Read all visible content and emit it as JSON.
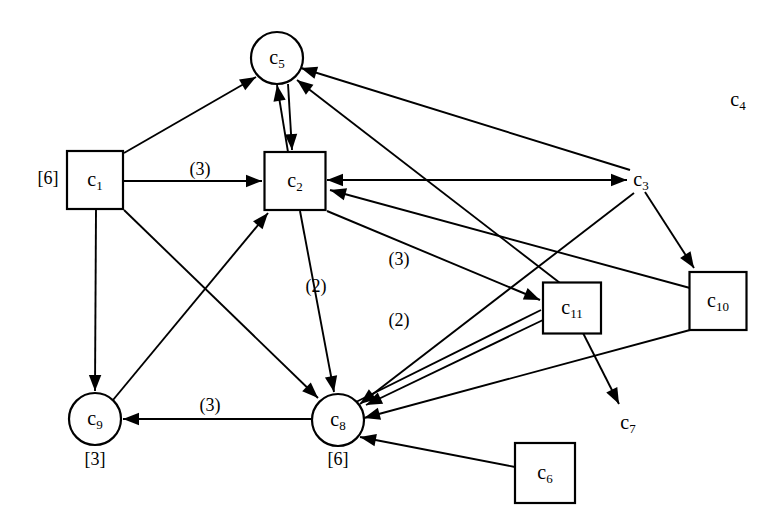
{
  "figure": {
    "kind": "directed-graph-diagram",
    "width": 783,
    "height": 532,
    "background_color": "#ffffff",
    "stroke_color": "#000000"
  },
  "nodes": [
    {
      "id": "c1",
      "label": "c",
      "sub": "1",
      "shape": "square",
      "x": 95,
      "y": 180,
      "w": 56,
      "h": 58,
      "r": 0,
      "supply": "[6]",
      "supply_x": 48,
      "supply_y": 180
    },
    {
      "id": "c2",
      "label": "c",
      "sub": "2",
      "shape": "square",
      "x": 295,
      "y": 181,
      "w": 61,
      "h": 58,
      "r": 0,
      "supply": "",
      "supply_x": 0,
      "supply_y": 0
    },
    {
      "id": "c3",
      "label": "c",
      "sub": "3",
      "shape": "none",
      "x": 641,
      "y": 180,
      "w": 0,
      "h": 0,
      "r": 0,
      "supply": "",
      "supply_x": 0,
      "supply_y": 0
    },
    {
      "id": "c4",
      "label": "c",
      "sub": "4",
      "shape": "none",
      "x": 738,
      "y": 100,
      "w": 0,
      "h": 0,
      "r": 0,
      "supply": "",
      "supply_x": 0,
      "supply_y": 0
    },
    {
      "id": "c5",
      "label": "c",
      "sub": "5",
      "shape": "circle",
      "x": 277,
      "y": 58,
      "w": 0,
      "h": 0,
      "r": 26,
      "supply": "",
      "supply_x": 0,
      "supply_y": 0
    },
    {
      "id": "c6",
      "label": "c",
      "sub": "6",
      "shape": "square",
      "x": 545,
      "y": 473,
      "w": 60,
      "h": 60,
      "r": 0,
      "supply": "",
      "supply_x": 0,
      "supply_y": 0
    },
    {
      "id": "c7",
      "label": "c",
      "sub": "7",
      "shape": "none",
      "x": 628,
      "y": 423,
      "w": 0,
      "h": 0,
      "r": 0,
      "supply": "",
      "supply_x": 0,
      "supply_y": 0
    },
    {
      "id": "c8",
      "label": "c",
      "sub": "8",
      "shape": "circle",
      "x": 338,
      "y": 420,
      "w": 0,
      "h": 0,
      "r": 26,
      "supply": "[6]",
      "supply_x": 338,
      "supply_y": 461
    },
    {
      "id": "c9",
      "label": "c",
      "sub": "9",
      "shape": "circle",
      "x": 95,
      "y": 419,
      "w": 0,
      "h": 0,
      "r": 26,
      "supply": "[3]",
      "supply_x": 95,
      "supply_y": 461
    },
    {
      "id": "c10",
      "label": "c",
      "sub": "10",
      "shape": "square",
      "x": 718,
      "y": 301,
      "w": 57,
      "h": 58,
      "r": 0,
      "supply": "",
      "supply_x": 0,
      "supply_y": 0
    },
    {
      "id": "c11",
      "label": "c",
      "sub": "11",
      "shape": "square",
      "x": 572,
      "y": 308,
      "w": 58,
      "h": 51,
      "r": 0,
      "supply": "",
      "supply_x": 0,
      "supply_y": 0
    }
  ],
  "edges": [
    {
      "id": "e-c1-c5",
      "from": "c1",
      "to": "c5",
      "x1": 124,
      "y1": 153,
      "x2": 256,
      "y2": 77,
      "arrow_end": true,
      "arrow_start": false,
      "label": "",
      "label_x": 0,
      "label_y": 0
    },
    {
      "id": "e-c1-c2",
      "from": "c1",
      "to": "c2",
      "x1": 124,
      "y1": 181,
      "x2": 262,
      "y2": 181,
      "arrow_end": true,
      "arrow_start": false,
      "label": "(3)",
      "label_x": 200,
      "label_y": 171
    },
    {
      "id": "e-c1-c9",
      "from": "c1",
      "to": "c9",
      "x1": 96,
      "y1": 210,
      "x2": 95,
      "y2": 391,
      "arrow_end": true,
      "arrow_start": false,
      "label": "",
      "label_x": 0,
      "label_y": 0
    },
    {
      "id": "e-c1-c8",
      "from": "c1",
      "to": "c8",
      "x1": 124,
      "y1": 210,
      "x2": 318,
      "y2": 398,
      "arrow_end": true,
      "arrow_start": false,
      "label": "",
      "label_x": 0,
      "label_y": 0
    },
    {
      "id": "e-c9-c2",
      "from": "c9",
      "to": "c2",
      "x1": 113,
      "y1": 400,
      "x2": 268,
      "y2": 213,
      "arrow_end": true,
      "arrow_start": false,
      "label": "",
      "label_x": 0,
      "label_y": 0
    },
    {
      "id": "e-c2-c5",
      "from": "c2",
      "to": "c5",
      "x1": 288,
      "y1": 152,
      "x2": 277,
      "y2": 85,
      "arrow_end": true,
      "arrow_start": false,
      "label": "",
      "label_x": 0,
      "label_y": 0
    },
    {
      "id": "e-c5-c2",
      "from": "c5",
      "to": "c2",
      "x1": 288,
      "y1": 84,
      "x2": 292,
      "y2": 150,
      "arrow_end": true,
      "arrow_start": false,
      "label": "",
      "label_x": 0,
      "label_y": 0
    },
    {
      "id": "e-c2-c3",
      "from": "c2",
      "to": "c3",
      "x1": 327,
      "y1": 180,
      "x2": 627,
      "y2": 180,
      "arrow_end": true,
      "arrow_start": true,
      "label": "",
      "label_x": 0,
      "label_y": 0
    },
    {
      "id": "e-c2-c8",
      "from": "c2",
      "to": "c8",
      "x1": 300,
      "y1": 211,
      "x2": 334,
      "y2": 392,
      "arrow_end": true,
      "arrow_start": false,
      "label": "(2)",
      "label_x": 316,
      "label_y": 288
    },
    {
      "id": "e-c2-c11",
      "from": "c2",
      "to": "c11",
      "x1": 327,
      "y1": 211,
      "x2": 540,
      "y2": 300,
      "arrow_end": true,
      "arrow_start": false,
      "label": "(3)",
      "label_x": 399,
      "label_y": 261
    },
    {
      "id": "e-c11-c5",
      "from": "c11",
      "to": "c5",
      "x1": 560,
      "y1": 283,
      "x2": 297,
      "y2": 80,
      "arrow_end": true,
      "arrow_start": false,
      "label": "",
      "label_x": 0,
      "label_y": 0
    },
    {
      "id": "e-c11-c8",
      "from": "c11",
      "to": "c8",
      "x1": 543,
      "y1": 320,
      "x2": 366,
      "y2": 405,
      "arrow_end": true,
      "arrow_start": false,
      "label": "",
      "label_x": 0,
      "label_y": 0
    },
    {
      "id": "e-c11-c7",
      "from": "c11",
      "to": "c7",
      "x1": 583,
      "y1": 333,
      "x2": 619,
      "y2": 404,
      "arrow_end": true,
      "arrow_start": false,
      "label": "",
      "label_x": 0,
      "label_y": 0
    },
    {
      "id": "e-c8-c11",
      "from": "c8",
      "to": "c11",
      "x1": 356,
      "y1": 402,
      "x2": 541,
      "y2": 310,
      "arrow_end": false,
      "arrow_start": false,
      "label": "(2)",
      "label_x": 399,
      "label_y": 322
    },
    {
      "id": "e-c3-c5",
      "from": "c3",
      "to": "c5",
      "x1": 630,
      "y1": 170,
      "x2": 301,
      "y2": 68,
      "arrow_end": true,
      "arrow_start": false,
      "label": "",
      "label_x": 0,
      "label_y": 0
    },
    {
      "id": "e-c3-c10",
      "from": "c3",
      "to": "c10",
      "x1": 645,
      "y1": 192,
      "x2": 694,
      "y2": 268,
      "arrow_end": true,
      "arrow_start": false,
      "label": "",
      "label_x": 0,
      "label_y": 0
    },
    {
      "id": "e-c3-c8",
      "from": "c3",
      "to": "c8",
      "x1": 634,
      "y1": 193,
      "x2": 360,
      "y2": 404,
      "arrow_end": true,
      "arrow_start": false,
      "label": "",
      "label_x": 0,
      "label_y": 0
    },
    {
      "id": "e-c10-c2",
      "from": "c10",
      "to": "c2",
      "x1": 690,
      "y1": 288,
      "x2": 330,
      "y2": 190,
      "arrow_end": true,
      "arrow_start": false,
      "label": "",
      "label_x": 0,
      "label_y": 0
    },
    {
      "id": "e-c10-c8",
      "from": "c10",
      "to": "c8",
      "x1": 690,
      "y1": 330,
      "x2": 364,
      "y2": 418,
      "arrow_end": true,
      "arrow_start": false,
      "label": "",
      "label_x": 0,
      "label_y": 0
    },
    {
      "id": "e-c6-c8",
      "from": "c6",
      "to": "c8",
      "x1": 515,
      "y1": 467,
      "x2": 360,
      "y2": 437,
      "arrow_end": true,
      "arrow_start": false,
      "label": "",
      "label_x": 0,
      "label_y": 0
    },
    {
      "id": "e-c8-c9",
      "from": "c8",
      "to": "c9",
      "x1": 312,
      "y1": 419,
      "x2": 123,
      "y2": 419,
      "arrow_end": true,
      "arrow_start": false,
      "label": "(3)",
      "label_x": 210,
      "label_y": 407
    }
  ],
  "legend": {
    "node_count": 11,
    "edge_count": 21,
    "supply_notation": "[n]",
    "cost_notation": "(n)"
  }
}
